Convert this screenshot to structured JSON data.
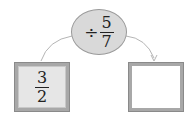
{
  "diagram": {
    "type": "function-machine",
    "operation": {
      "operator": "÷",
      "numerator": "5",
      "denominator": "7"
    },
    "input": {
      "numerator": "3",
      "denominator": "2"
    },
    "output": {
      "value": ""
    },
    "colors": {
      "ellipse_fill": "#d9d9d9",
      "box_border": "#a8a8a8",
      "input_fill": "#e6e6e6",
      "arrow": "#b0b0b0"
    }
  }
}
